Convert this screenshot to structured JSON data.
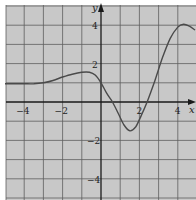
{
  "chart_data": {
    "type": "line",
    "title": "",
    "xlabel": "x",
    "ylabel": "y",
    "xlim": [
      -5,
      4.9
    ],
    "ylim": [
      -5,
      5
    ],
    "grid": true,
    "grid_step": 1,
    "legend": null,
    "x_ticks": [
      {
        "value": -4,
        "label": "−4"
      },
      {
        "value": -2,
        "label": "−2"
      },
      {
        "value": 2,
        "label": "2"
      },
      {
        "value": 4,
        "label": "4"
      }
    ],
    "y_ticks": [
      {
        "value": 4,
        "label": "4"
      },
      {
        "value": 2,
        "label": "2"
      },
      {
        "value": -2,
        "label": "−2"
      },
      {
        "value": -4,
        "label": "−4"
      }
    ],
    "series": [
      {
        "name": "f(x)",
        "color": "#4a4a4a",
        "points": [
          [
            -5.0,
            0.95
          ],
          [
            -4.5,
            0.95
          ],
          [
            -4.0,
            0.95
          ],
          [
            -3.5,
            0.95
          ],
          [
            -3.0,
            1.0
          ],
          [
            -2.5,
            1.12
          ],
          [
            -2.0,
            1.3
          ],
          [
            -1.5,
            1.45
          ],
          [
            -1.0,
            1.55
          ],
          [
            -0.6,
            1.55
          ],
          [
            -0.3,
            1.4
          ],
          [
            0.0,
            1.0
          ],
          [
            0.3,
            0.45
          ],
          [
            0.6,
            0.0
          ],
          [
            0.9,
            -0.6
          ],
          [
            1.2,
            -1.2
          ],
          [
            1.5,
            -1.5
          ],
          [
            1.8,
            -1.3
          ],
          [
            2.1,
            -0.7
          ],
          [
            2.4,
            0.0
          ],
          [
            2.8,
            1.1
          ],
          [
            3.2,
            2.3
          ],
          [
            3.6,
            3.3
          ],
          [
            4.0,
            3.9
          ],
          [
            4.3,
            4.05
          ],
          [
            4.6,
            3.95
          ],
          [
            4.9,
            3.75
          ]
        ]
      }
    ],
    "features": {
      "local_max_left": [
        -0.6,
        1.55
      ],
      "y_intercept": [
        0,
        1.0
      ],
      "x_intercepts": [
        0.6,
        2.4
      ],
      "local_min": [
        1.5,
        -1.5
      ],
      "local_max_right": [
        4.3,
        4.05
      ],
      "left_asymptote_value": 0.95
    }
  },
  "colors": {
    "background": "#c8c8c8",
    "grid": "#5e5e5e",
    "axis": "#1a1a1a",
    "curve": "#4a4a4a",
    "label": "#222222"
  },
  "axes": {
    "x_label": "x",
    "y_label": "y"
  }
}
